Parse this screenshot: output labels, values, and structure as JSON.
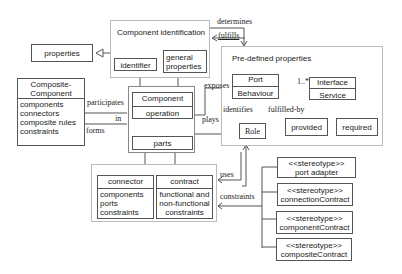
{
  "diagram": {
    "packages": {
      "component_identification": {
        "title": "Component identification",
        "items": [
          "identifier",
          "general properties"
        ]
      },
      "predefined_properties": {
        "title": "Pre-defined properties"
      },
      "component_group": {},
      "connector_contract_group": {}
    },
    "classes": {
      "properties": "properties",
      "composite_component": {
        "name": "Composite-Component",
        "attributes": [
          "components",
          "connectors",
          "composite rules",
          "constraints"
        ]
      },
      "component": {
        "name": "Component",
        "operation": "operation"
      },
      "parts": "parts",
      "port": {
        "name": "Port",
        "operation": "Behaviour"
      },
      "interface": {
        "name": "Interface",
        "operation": "Service"
      },
      "role": "Role",
      "provided": "provided",
      "required": "required",
      "connector": {
        "name": "connector",
        "attributes": [
          "components",
          "ports",
          "constraints"
        ]
      },
      "contract": {
        "name": "contract",
        "attributes": [
          "functional and",
          "non-functional",
          "constraints"
        ]
      },
      "stereotypes": [
        {
          "stereotype": "<<stereotype>>",
          "name": "port adapter"
        },
        {
          "stereotype": "<<stereotype>>",
          "name": "connectionContract"
        },
        {
          "stereotype": "<<stereotype>>",
          "name": "componentContract"
        },
        {
          "stereotype": "<<stereotype>>",
          "name": "compositeContract"
        }
      ]
    },
    "relations": {
      "determines": "determines",
      "fulfills": "fulfills",
      "participates": "participates",
      "in": "in",
      "forms": "forms",
      "exposes": "exposes",
      "identifies": "identifies",
      "plays": "plays",
      "fulfilled_by": "fulfilled-by",
      "multiplicity": "1..*",
      "uses": "uses",
      "constraints": "constraints"
    }
  }
}
